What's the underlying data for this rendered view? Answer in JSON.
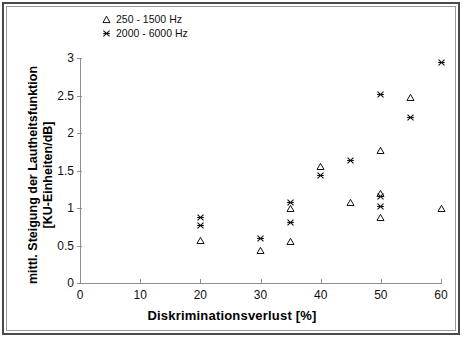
{
  "chart_data": {
    "type": "scatter",
    "title": "",
    "xlabel": "Diskriminationsverlust [%]",
    "ylabel": "mittl. Steigung der Lautheitsfunktion [KU-Einheiten/dB]",
    "ylabel_line1": "mittl. Steigung der Lautheitsfunktion",
    "ylabel_line2": "[KU-Einheiten/dB]",
    "xlim": [
      0,
      60
    ],
    "ylim": [
      0,
      3
    ],
    "xticks": [
      0,
      10,
      20,
      30,
      40,
      50,
      60
    ],
    "yticks": [
      0,
      0.5,
      1,
      1.5,
      2,
      2.5,
      3
    ],
    "xtick_labels": [
      "0",
      "10",
      "20",
      "30",
      "40",
      "50",
      "60"
    ],
    "ytick_labels": [
      "0",
      "0.5",
      "1",
      "1.5",
      "2",
      "2.5",
      "3"
    ],
    "grid": false,
    "legend_position": "top-left",
    "series": [
      {
        "name": "250 - 1500 Hz",
        "marker": "triangle",
        "color": "#111111",
        "points": [
          {
            "x": 20,
            "y": 0.57
          },
          {
            "x": 30,
            "y": 0.43
          },
          {
            "x": 35,
            "y": 0.55
          },
          {
            "x": 35,
            "y": 1.0
          },
          {
            "x": 40,
            "y": 1.55
          },
          {
            "x": 45,
            "y": 1.07
          },
          {
            "x": 50,
            "y": 0.87
          },
          {
            "x": 50,
            "y": 1.19
          },
          {
            "x": 50,
            "y": 1.77
          },
          {
            "x": 55,
            "y": 2.48
          },
          {
            "x": 60,
            "y": 1.0
          }
        ]
      },
      {
        "name": "2000 - 6000 Hz",
        "marker": "x",
        "color": "#111111",
        "points": [
          {
            "x": 20,
            "y": 0.77
          },
          {
            "x": 20,
            "y": 0.87
          },
          {
            "x": 30,
            "y": 0.59
          },
          {
            "x": 35,
            "y": 0.81
          },
          {
            "x": 35,
            "y": 1.08
          },
          {
            "x": 40,
            "y": 1.43
          },
          {
            "x": 45,
            "y": 1.63
          },
          {
            "x": 50,
            "y": 1.02
          },
          {
            "x": 50,
            "y": 1.16
          },
          {
            "x": 50,
            "y": 2.52
          },
          {
            "x": 55,
            "y": 2.21
          },
          {
            "x": 60,
            "y": 2.94
          }
        ]
      }
    ]
  },
  "legend": {
    "items": [
      {
        "label": "250 - 1500 Hz",
        "marker": "triangle"
      },
      {
        "label": "2000 - 6000 Hz",
        "marker": "x"
      }
    ]
  }
}
